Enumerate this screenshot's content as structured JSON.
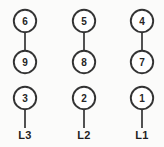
{
  "diagram": {
    "background_color": "#fbfbfa",
    "stroke_color": "#333333",
    "fill_color": "#ffffff",
    "text_color": "#1f1f1f",
    "columns": [
      {
        "id": "col-l3",
        "cx": 25,
        "terminal_label": "L3",
        "pair": {
          "top": "6",
          "bottom": "9"
        },
        "single": "3"
      },
      {
        "id": "col-l2",
        "cx": 84,
        "terminal_label": "L2",
        "pair": {
          "top": "5",
          "bottom": "8"
        },
        "single": "2"
      },
      {
        "id": "col-l1",
        "cx": 142,
        "terminal_label": "L1",
        "pair": {
          "top": "4",
          "bottom": "7"
        },
        "single": "1"
      }
    ],
    "geometry": {
      "radius": 11.2,
      "row_top_cy": 21,
      "row_mid_cy": 62,
      "row_single_cy": 98,
      "label_baseline_y": 139
    }
  }
}
